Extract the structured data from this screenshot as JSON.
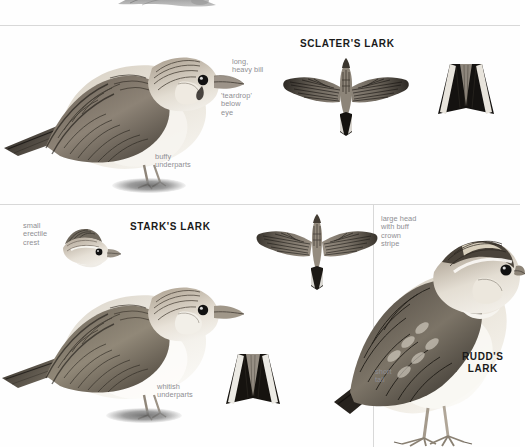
{
  "page": {
    "type": "field-guide-plate",
    "background": "#fefefe",
    "rule_color": "#d8d8d8",
    "label_color": "#8e8e93",
    "heading_color": "#1a1a1a"
  },
  "top_crop": {
    "caption": "",
    "figure_name": "partial-bird-illustration"
  },
  "panels": [
    {
      "id": "sclaters",
      "heading": "SCLATER'S LARK",
      "labels": [
        {
          "text": "long,\nheavy bill"
        },
        {
          "text": "'teardrop'\nbelow\neye"
        },
        {
          "text": "buffy\nunderparts"
        }
      ],
      "figures": [
        {
          "name": "perched-bird",
          "view": "side"
        },
        {
          "name": "flight-bird",
          "view": "upperside"
        },
        {
          "name": "tail-detail",
          "view": "spread-tail"
        }
      ]
    },
    {
      "id": "starks",
      "heading": "STARK'S LARK",
      "labels": [
        {
          "text": "small\nerectile\ncrest"
        },
        {
          "text": "whitish\nunderparts"
        }
      ],
      "figures": [
        {
          "name": "head-detail",
          "view": "head-crest"
        },
        {
          "name": "perched-bird",
          "view": "side"
        },
        {
          "name": "flight-bird",
          "view": "upperside"
        },
        {
          "name": "tail-detail",
          "view": "spread-tail"
        }
      ]
    },
    {
      "id": "rudds",
      "heading": "RUDD'S\nLARK",
      "labels": [
        {
          "text": "large head\nwith buff\ncrown\nstripe"
        },
        {
          "text": "short\ntail"
        }
      ],
      "figures": [
        {
          "name": "perched-bird",
          "view": "side"
        }
      ]
    }
  ]
}
